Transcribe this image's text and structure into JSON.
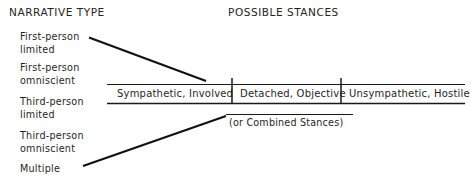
{
  "headers": {
    "left": "NARRATIVE TYPE",
    "right": "POSSIBLE STANCES"
  },
  "narrative_types": [
    {
      "line1": "First-person",
      "line2": "limited"
    },
    {
      "line1": "First-person",
      "line2": "omniscient"
    },
    {
      "line1": "Third-person",
      "line2": "limited"
    },
    {
      "line1": "Third-person",
      "line2": "omniscient"
    },
    {
      "line1": "Multiple",
      "line2": ""
    }
  ],
  "stances": [
    {
      "label": "Sympathetic, Involved"
    },
    {
      "label": "Detached, Objective"
    },
    {
      "label": "Unsympathetic, Hostile"
    }
  ],
  "note": "(or Combined Stances)",
  "colors": {
    "ink": "#1a1a1a",
    "background": "#ffffff"
  }
}
